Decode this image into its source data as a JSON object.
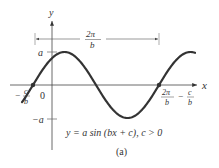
{
  "diagram": {
    "type": "sine-graph",
    "axes": {
      "x_label": "x",
      "y_label": "y",
      "origin_label": "0"
    },
    "y_ticks": [
      {
        "label": "a",
        "value": 1
      },
      {
        "label": "−a",
        "value": -1
      }
    ],
    "x_intercepts": {
      "left": {
        "num": "c",
        "den": "b",
        "prefix": "−"
      },
      "right": {
        "num1": "2π",
        "den1": "b",
        "minus": "−",
        "num2": "c",
        "den2": "b"
      }
    },
    "period_bracket": {
      "num": "2π",
      "den": "b"
    },
    "equation": "y = a sin (bx + c), c > 0",
    "caption": "(a)",
    "colors": {
      "curve": "#333333",
      "axis": "#444444",
      "bracket": "#555555"
    }
  }
}
